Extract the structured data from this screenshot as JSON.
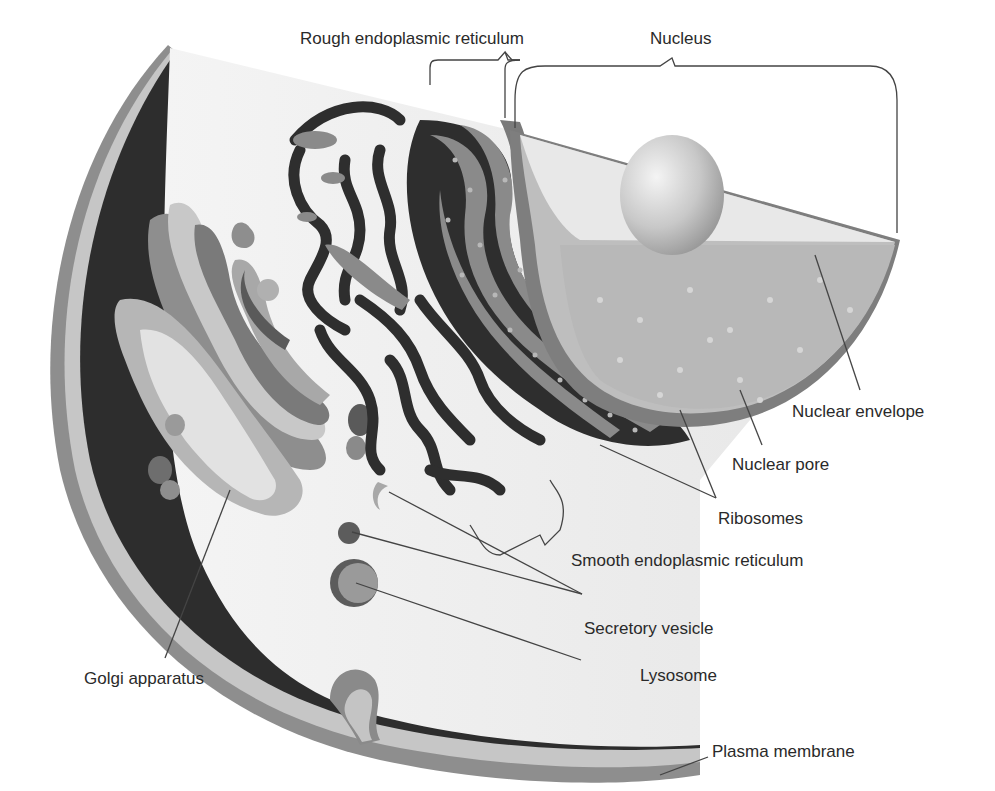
{
  "diagram": {
    "colors": {
      "background": "#ffffff",
      "cytoplasm_face": "#ececec",
      "cytoplasm_dark": "#2e2e2e",
      "membrane_mid": "#8a8a8a",
      "membrane_light": "#c4c4c4",
      "nucleus_light": "#dcdcdc",
      "nucleus_shade": "#b9b9b9",
      "leader_line": "#333333",
      "label_text": "#2a2a2a"
    },
    "labels": {
      "rough_er": "Rough endoplasmic reticulum",
      "nucleus": "Nucleus",
      "nuclear_envelope": "Nuclear envelope",
      "nuclear_pore": "Nuclear pore",
      "ribosomes": "Ribosomes",
      "smooth_er": "Smooth endoplasmic reticulum",
      "secretory_vesicle": "Secretory vesicle",
      "golgi": "Golgi apparatus",
      "lysosome": "Lysosome",
      "plasma_membrane": "Plasma membrane"
    }
  }
}
